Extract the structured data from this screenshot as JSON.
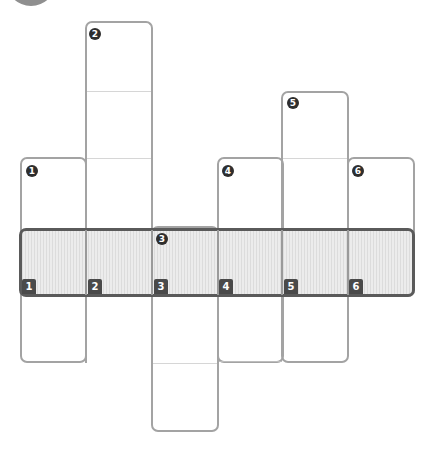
{
  "diagram": {
    "type": "cube-net-style strip diagram",
    "colors": {
      "column_border": "#a3a3a3",
      "band_border": "#5a5a5a",
      "band_fill": "#e6e6e6",
      "badge": "#2e2e2e",
      "divider": "#d6d6d6"
    },
    "column_markers": [
      {
        "label": "1",
        "glyph": "❶"
      },
      {
        "label": "2",
        "glyph": "❷"
      },
      {
        "label": "3",
        "glyph": "❸"
      },
      {
        "label": "4",
        "glyph": "❹"
      },
      {
        "label": "5",
        "glyph": "❺"
      },
      {
        "label": "6",
        "glyph": "❻"
      }
    ],
    "band_labels": [
      "1",
      "2",
      "3",
      "4",
      "5",
      "6"
    ]
  }
}
